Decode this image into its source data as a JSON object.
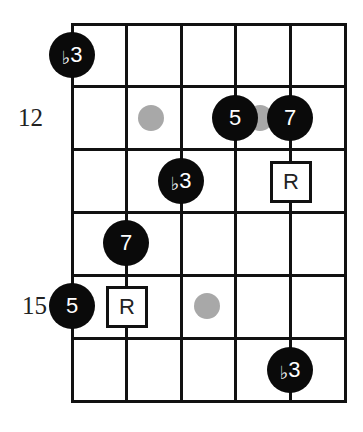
{
  "diagram": {
    "type": "guitar-fretboard-scale-diagram",
    "strings": 6,
    "rows": 6,
    "fret_labels": [
      {
        "text": "12",
        "row": 2
      },
      {
        "text": "15",
        "row": 5
      }
    ],
    "notes": [
      {
        "label_flat": "♭",
        "label_num": "3",
        "string": 1,
        "row": 1,
        "kind": "filled"
      },
      {
        "label_flat": "",
        "label_num": "5",
        "string": 4,
        "row": 2,
        "kind": "filled"
      },
      {
        "label_flat": "",
        "label_num": "7",
        "string": 5,
        "row": 2,
        "kind": "filled"
      },
      {
        "label_flat": "♭",
        "label_num": "3",
        "string": 3,
        "row": 3,
        "kind": "filled"
      },
      {
        "label_flat": "",
        "label_num": "7",
        "string": 2,
        "row": 4,
        "kind": "filled"
      },
      {
        "label_flat": "",
        "label_num": "5",
        "string": 1,
        "row": 5,
        "kind": "filled"
      },
      {
        "label_flat": "♭",
        "label_num": "3",
        "string": 5,
        "row": 6,
        "kind": "filled"
      }
    ],
    "roots": [
      {
        "label": "R",
        "string": 5,
        "row": 3
      },
      {
        "label": "R",
        "string": 2,
        "row": 5
      }
    ],
    "ghost_dots": [
      {
        "x_between_strings": [
          2,
          3
        ],
        "row": 2
      },
      {
        "x_between_strings": [
          4,
          5
        ],
        "row": 2
      },
      {
        "x_between_strings": [
          3,
          4
        ],
        "row": 5
      }
    ],
    "colors": {
      "note_fill": "#0a0a0a",
      "note_text": "#ffffff",
      "root_border": "#111111",
      "ghost_dot": "#a8a8a8",
      "grid": "#111111"
    }
  }
}
